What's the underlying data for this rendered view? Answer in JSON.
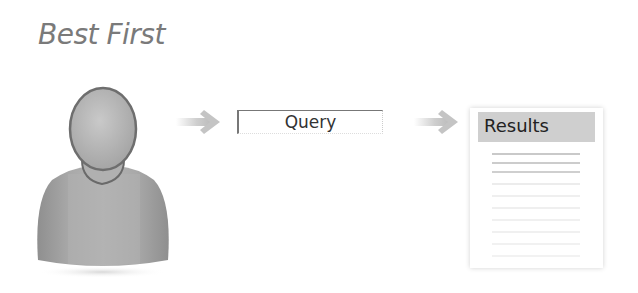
{
  "title": "Best First",
  "diagram": {
    "nodes": [
      {
        "id": "user",
        "icon": "user-silhouette-icon"
      },
      {
        "id": "query",
        "label": "Query"
      },
      {
        "id": "results",
        "label": "Results",
        "icon": "document-icon"
      }
    ],
    "edges": [
      {
        "from": "user",
        "to": "query",
        "icon": "arrow-right-icon"
      },
      {
        "from": "query",
        "to": "results",
        "icon": "arrow-right-icon"
      }
    ]
  },
  "query": {
    "label": "Query"
  },
  "results": {
    "label": "Results",
    "line_count": 11
  },
  "colors": {
    "title": "#7a7a7a",
    "arrow": "#c8c8c8",
    "header_fill": "#cfcfcf",
    "user_fill": "#a8a8a8"
  }
}
